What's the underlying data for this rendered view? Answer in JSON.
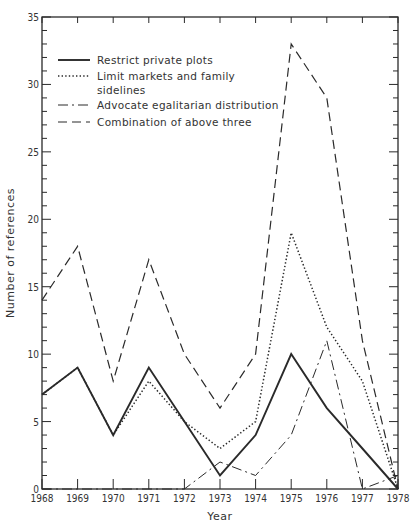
{
  "chart_data": {
    "type": "line",
    "title": "",
    "xlabel": "Year",
    "ylabel": "Number of references",
    "x": [
      1968,
      1969,
      1970,
      1971,
      1972,
      1973,
      1974,
      1975,
      1976,
      1977,
      1978
    ],
    "xlim": [
      1968,
      1978
    ],
    "ylim": [
      0,
      35
    ],
    "y_ticks_major": [
      0,
      5,
      10,
      15,
      20,
      25,
      30,
      35
    ],
    "y_ticks_minor_step": 1,
    "grid": false,
    "legend_position": "upper-left",
    "series": [
      {
        "name": "Restrict private plots",
        "style": "solid",
        "values": [
          7,
          9,
          4,
          9,
          5,
          1,
          4,
          10,
          6,
          3,
          0
        ]
      },
      {
        "name": "Limit markets and family sidelines",
        "style": "dotted",
        "values": [
          7,
          9,
          4,
          8,
          5,
          3,
          5,
          19,
          12,
          8,
          0
        ]
      },
      {
        "name": "Advocate egalitarian distribution",
        "style": "dashdot",
        "values": [
          0,
          0,
          0,
          0,
          0,
          2,
          1,
          4,
          11,
          0,
          1
        ]
      },
      {
        "name": "Combination of above three",
        "style": "dashed",
        "values": [
          14,
          18,
          8,
          17,
          10,
          6,
          10,
          33,
          29,
          11,
          0
        ]
      }
    ]
  },
  "legend": {
    "items": [
      {
        "line1": "Restrict private plots",
        "line2": ""
      },
      {
        "line1": "Limit markets and family",
        "line2": "sidelines"
      },
      {
        "line1": "Advocate egalitarian distribution",
        "line2": ""
      },
      {
        "line1": "Combination of above three",
        "line2": ""
      }
    ]
  },
  "axes": {
    "x_title": "Year",
    "y_title": "Number of references",
    "x_tick_labels": [
      "1968",
      "1969",
      "1970",
      "1971",
      "1972",
      "1973",
      "1974",
      "1975",
      "1976",
      "1977",
      "1978"
    ],
    "y_tick_labels": [
      "0",
      "5",
      "10",
      "15",
      "20",
      "25",
      "30",
      "35"
    ]
  },
  "colors": {
    "ink": "#2a2a2a",
    "background": "#ffffff"
  }
}
